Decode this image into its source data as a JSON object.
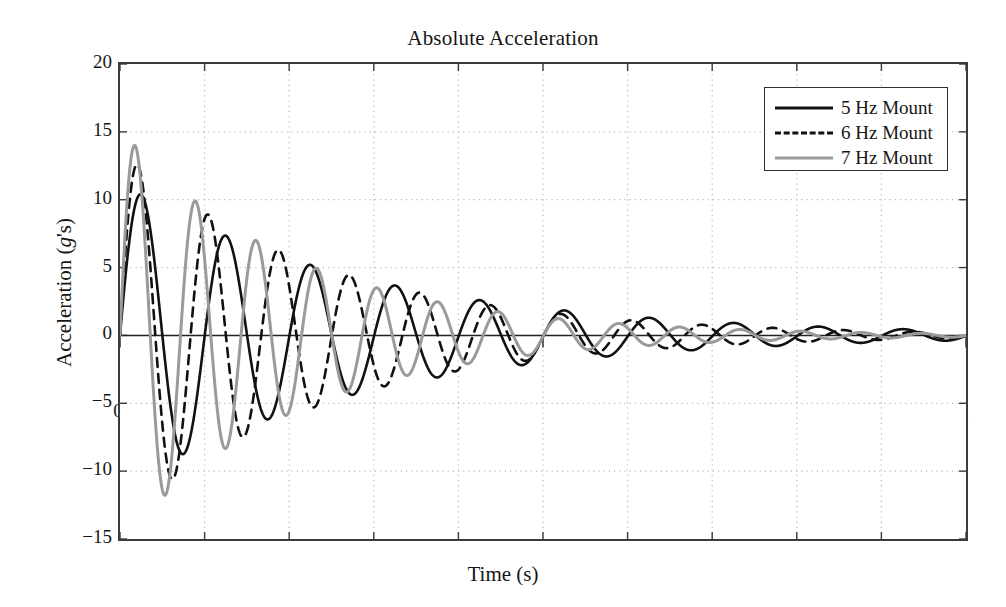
{
  "chart_data": {
    "type": "line",
    "title": "Absolute Acceleration",
    "xlabel": "Time (s)",
    "ylabel": "Acceleration (g's)",
    "ylabel_parts": {
      "lead": "Acceleration (",
      "italic": "g",
      "trail": "'s)"
    },
    "xlim": [
      0,
      2
    ],
    "ylim": [
      -15,
      20
    ],
    "xticks": [
      0,
      0.2,
      0.4,
      0.6,
      0.8,
      1,
      1.2,
      1.4,
      1.6,
      1.8,
      2
    ],
    "xtick_labels": [
      "0",
      "0.2",
      "0.4",
      "0.6",
      "0.8",
      "1",
      "1.2",
      "1.4",
      "1.6",
      "1.8",
      "2"
    ],
    "yticks": [
      20,
      15,
      10,
      5,
      0,
      -5,
      -10,
      -15
    ],
    "ytick_labels": [
      "20",
      "15",
      "10",
      "5",
      "0",
      "−5",
      "−10",
      "−15"
    ],
    "grid": "dotted",
    "legend_position": "top-right",
    "series": [
      {
        "name": "5 Hz Mount",
        "style": "solid",
        "color": "#111111",
        "frequency_hz": 5.0,
        "damping_ratio": 0.055,
        "amplitude": 10.4,
        "phase_deg": 0,
        "peaks": [
          {
            "t": 0.05,
            "a": 10.35
          },
          {
            "t": 0.25,
            "a": 6.3
          },
          {
            "t": 0.45,
            "a": 3.9
          },
          {
            "t": 0.65,
            "a": 2.5
          },
          {
            "t": 0.85,
            "a": 1.6
          },
          {
            "t": 1.05,
            "a": 1.0
          },
          {
            "t": 1.25,
            "a": 0.65
          }
        ],
        "troughs": [
          {
            "t": 0.15,
            "a": -8.2
          },
          {
            "t": 0.35,
            "a": -5.2
          },
          {
            "t": 0.55,
            "a": -3.2
          },
          {
            "t": 0.75,
            "a": -2.0
          },
          {
            "t": 0.95,
            "a": -1.3
          }
        ]
      },
      {
        "name": "6 Hz Mount",
        "style": "dashed",
        "color": "#111111",
        "frequency_hz": 6.0,
        "damping_ratio": 0.055,
        "amplitude": 12.6,
        "phase_deg": 0,
        "peaks": [
          {
            "t": 0.042,
            "a": 12.6
          },
          {
            "t": 0.208,
            "a": 8.3
          },
          {
            "t": 0.375,
            "a": 5.4
          },
          {
            "t": 0.542,
            "a": 3.5
          },
          {
            "t": 0.708,
            "a": 2.3
          },
          {
            "t": 0.875,
            "a": 1.5
          }
        ],
        "troughs": [
          {
            "t": 0.125,
            "a": -10.1
          },
          {
            "t": 0.292,
            "a": -6.6
          },
          {
            "t": 0.458,
            "a": -4.3
          },
          {
            "t": 0.625,
            "a": -2.8
          },
          {
            "t": 0.792,
            "a": -1.8
          }
        ]
      },
      {
        "name": "7 Hz Mount",
        "style": "solid",
        "color": "#9a9a9a",
        "frequency_hz": 7.0,
        "damping_ratio": 0.055,
        "amplitude": 14.0,
        "phase_deg": 0,
        "peaks": [
          {
            "t": 0.036,
            "a": 14.0
          },
          {
            "t": 0.179,
            "a": 8.6
          },
          {
            "t": 0.321,
            "a": 5.3
          },
          {
            "t": 0.464,
            "a": 3.3
          },
          {
            "t": 0.607,
            "a": 2.0
          },
          {
            "t": 0.75,
            "a": 1.25
          }
        ],
        "troughs": [
          {
            "t": 0.107,
            "a": -11.2
          },
          {
            "t": 0.25,
            "a": -6.9
          },
          {
            "t": 0.393,
            "a": -4.3
          },
          {
            "t": 0.536,
            "a": -2.6
          },
          {
            "t": 0.679,
            "a": -1.6
          }
        ]
      }
    ],
    "legend": [
      {
        "label": "5 Hz Mount",
        "style": "solid",
        "color": "#111111"
      },
      {
        "label": "6 Hz Mount",
        "style": "dashed",
        "color": "#111111"
      },
      {
        "label": "7 Hz Mount",
        "style": "solid",
        "color": "#9a9a9a"
      }
    ]
  }
}
